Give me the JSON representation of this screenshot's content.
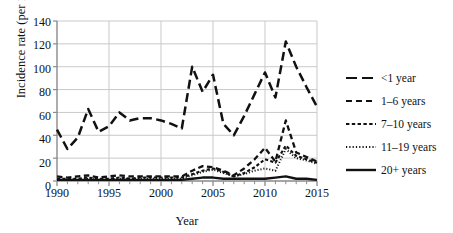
{
  "chart_data": {
    "type": "line",
    "title": "",
    "xlabel": "Year",
    "ylabel": "Incidence rate (per 100,000)",
    "xlim": [
      1990,
      2015
    ],
    "ylim": [
      0,
      140
    ],
    "yticks": [
      0,
      20,
      40,
      60,
      80,
      100,
      120,
      140
    ],
    "xticks": [
      1990,
      1995,
      2000,
      2005,
      2010,
      2015
    ],
    "grid": "horizontal",
    "legend_position": "right",
    "x": [
      1990,
      1991,
      1992,
      1993,
      1994,
      1995,
      1996,
      1997,
      1998,
      1999,
      2000,
      2001,
      2002,
      2003,
      2004,
      2005,
      2006,
      2007,
      2008,
      2009,
      2010,
      2011,
      2012,
      2013,
      2014,
      2015
    ],
    "series": [
      {
        "name": "<1 year",
        "dash": "long-dash",
        "values": [
          45,
          28,
          38,
          63,
          43,
          48,
          60,
          53,
          55,
          55,
          53,
          50,
          46,
          100,
          78,
          93,
          50,
          40,
          57,
          76,
          95,
          73,
          122,
          100,
          82,
          65
        ]
      },
      {
        "name": "1–6 years",
        "dash": "medium-dash",
        "values": [
          4,
          3,
          4,
          5,
          3,
          4,
          5,
          4,
          4,
          4,
          4,
          4,
          4,
          9,
          13,
          12,
          9,
          5,
          11,
          19,
          29,
          17,
          53,
          25,
          21,
          17
        ]
      },
      {
        "name": "7–10 years",
        "dash": "short-dash",
        "values": [
          2,
          2,
          2,
          3,
          2,
          2,
          3,
          2,
          3,
          3,
          3,
          3,
          3,
          6,
          9,
          11,
          8,
          4,
          7,
          12,
          19,
          16,
          31,
          22,
          19,
          16
        ]
      },
      {
        "name": "11–19 years",
        "dash": "dotted",
        "values": [
          1,
          1,
          1,
          2,
          1,
          1,
          2,
          2,
          2,
          2,
          2,
          2,
          2,
          5,
          8,
          10,
          7,
          4,
          6,
          9,
          11,
          9,
          28,
          20,
          18,
          15
        ]
      },
      {
        "name": "20+ years",
        "dash": "solid",
        "values": [
          1,
          1,
          1,
          1,
          1,
          1,
          1,
          1,
          1,
          1,
          1,
          1,
          1,
          2,
          3,
          3,
          2,
          2,
          2,
          2,
          2,
          3,
          4,
          2,
          2,
          1
        ]
      }
    ]
  },
  "axis": {
    "y_tick_labels": [
      "0",
      "20",
      "40",
      "60",
      "80",
      "100",
      "120",
      "140"
    ],
    "x_tick_labels": [
      "1990",
      "1995",
      "2000",
      "2005",
      "2010",
      "2015"
    ],
    "y_title": "Incidence rate (per 100,000)",
    "x_title": "Year"
  },
  "legend": {
    "items": [
      {
        "label": "<1 year"
      },
      {
        "label": "1–6 years"
      },
      {
        "label": "7–10 years"
      },
      {
        "label": "11–19 years"
      },
      {
        "label": "20+ years"
      }
    ]
  },
  "colors": {
    "line": "#111111",
    "grid": "#c9c9c9",
    "axis": "#8a8a8a",
    "background": "#ffffff"
  }
}
